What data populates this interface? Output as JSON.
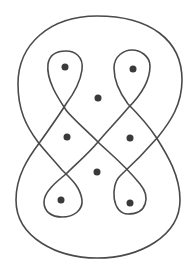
{
  "diagram": {
    "type": "knot-curve-with-punctures",
    "stroke_color": "#4a4a4a",
    "dot_color": "#3a3a3a",
    "background": "#ffffff",
    "curve": {
      "description": "single closed curve with outer rounded boundary and four teardrop loops crossing in a braid pattern",
      "path": "M 97 16 C 150 16 182 40 182 80 C 182 105 170 122 158 137 C 145 152 132 165 120 176 C 110 186 112 214 128 214 C 148 214 150 196 140 184 C 122 162 108 152 98 142 C 86 130 72 118 66 110 C 58 98 46 80 48 64 C 50 52 60 51 66 51 C 74 51 84 56 82 70 C 80 84 72 96 66 104 C 60 114 50 128 40 142 C 28 158 16 176 16 200 C 16 238 58 258 97 258 C 140 258 180 236 180 200 C 180 176 168 156 156 137 C 146 122 136 112 128 104 C 122 96 114 84 114 68 C 114 56 124 50 132 50 C 140 50 150 56 150 66 C 150 82 140 96 128 108 C 118 120 108 130 98 142 C 88 154 76 164 66 174 C 56 182 44 192 44 202 C 44 212 52 217 62 217 C 74 217 83 210 82 200 C 80 186 70 178 62 170 C 52 158 44 150 38 142 C 26 126 18 110 18 84 C 18 44 50 16 97 16 Z"
    },
    "dots": [
      {
        "name": "dot-top-left",
        "cx": 65,
        "cy": 67
      },
      {
        "name": "dot-top-right",
        "cx": 133,
        "cy": 69
      },
      {
        "name": "dot-center-top",
        "cx": 98,
        "cy": 98
      },
      {
        "name": "dot-middle-left",
        "cx": 67,
        "cy": 137
      },
      {
        "name": "dot-middle-right",
        "cx": 130,
        "cy": 138
      },
      {
        "name": "dot-center-bottom",
        "cx": 97,
        "cy": 172
      },
      {
        "name": "dot-bottom-left",
        "cx": 61,
        "cy": 200
      },
      {
        "name": "dot-bottom-right",
        "cx": 130,
        "cy": 203
      }
    ],
    "dot_radius": 3.5
  }
}
